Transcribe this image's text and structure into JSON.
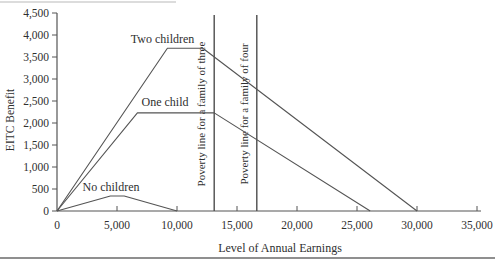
{
  "chart_data": {
    "type": "line",
    "title": "",
    "xlabel": "Level of Annual Earnings",
    "ylabel": "EITC Benefit",
    "xlim": [
      0,
      35000
    ],
    "ylim": [
      0,
      4500
    ],
    "grid": false,
    "legend": "inline-labels",
    "x_ticks": [
      0,
      5000,
      10000,
      15000,
      20000,
      25000,
      30000,
      35000
    ],
    "x_tick_labels": [
      "0",
      "5,000",
      "10,000",
      "15,000",
      "20,000",
      "25,000",
      "30,000",
      "35,000"
    ],
    "y_ticks": [
      0,
      500,
      1000,
      1500,
      2000,
      2500,
      3000,
      3500,
      4000,
      4500
    ],
    "y_tick_labels": [
      "0",
      "500",
      "1,000",
      "1,500",
      "2,000",
      "2,500",
      "3,000",
      "3,500",
      "4,000",
      "4,500"
    ],
    "series": [
      {
        "id": "two-children",
        "label": "Two children",
        "points": [
          [
            0,
            0
          ],
          [
            9200,
            3700
          ],
          [
            12150,
            3700
          ],
          [
            30000,
            0
          ]
        ],
        "label_at": [
          8800,
          3900
        ]
      },
      {
        "id": "one-child",
        "label": "One child",
        "points": [
          [
            0,
            0
          ],
          [
            6700,
            2230
          ],
          [
            13100,
            2230
          ],
          [
            26100,
            0
          ]
        ],
        "label_at": [
          9000,
          2480
        ]
      },
      {
        "id": "no-children",
        "label": "No children",
        "points": [
          [
            0,
            0
          ],
          [
            4450,
            340
          ],
          [
            5600,
            340
          ],
          [
            10000,
            0
          ]
        ],
        "label_at": [
          4500,
          540
        ]
      }
    ],
    "reference_lines": [
      {
        "id": "poverty-line-family-of-three",
        "label": "Poverty line for a family of three",
        "x": 13100
      },
      {
        "id": "poverty-line-family-of-four",
        "label": "Poverty line for a family of four",
        "x": 16650
      }
    ],
    "colors": {
      "line": "#545454",
      "reference_line": "#4d4d4d",
      "text": "#2f2f2f",
      "background": "#ffffff"
    }
  }
}
